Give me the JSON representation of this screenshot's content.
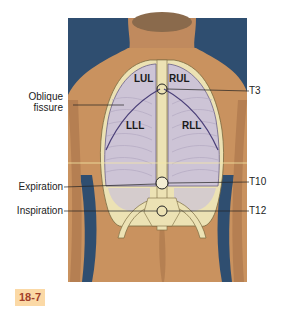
{
  "figure": {
    "number_badge": "18-7",
    "colors": {
      "background_blue": "#2f4e70",
      "skin": "#c9925f",
      "lung_fill": "#cdc4d6",
      "bone_fill": "#ece2b4",
      "badge_bg": "#fbd9a6",
      "badge_text": "#a2402a"
    },
    "lobe_labels": {
      "left_upper": "LUL",
      "right_upper": "RUL",
      "left_lower": "LLL",
      "right_lower": "RLL"
    },
    "left_labels": {
      "oblique_line1": "Oblique",
      "oblique_line2": "fissure",
      "expiration": "Expiration",
      "inspiration": "Inspiration"
    },
    "right_labels": {
      "t3": "T3",
      "t10": "T10",
      "t12": "T12"
    }
  }
}
